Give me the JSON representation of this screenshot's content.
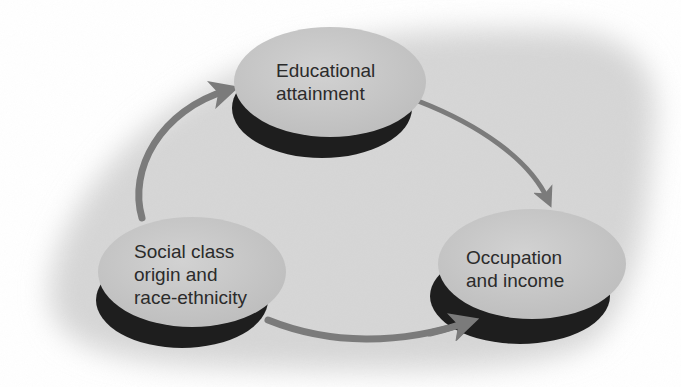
{
  "diagram": {
    "type": "flow-cycle",
    "colors": {
      "background_blob": "#d9d9d9",
      "node_face": "#c9c9c9",
      "node_shadow": "#1e1e1e",
      "arrow": "#7b7b7b",
      "text": "#2b2b2b"
    },
    "nodes": [
      {
        "id": "education",
        "lines": [
          "Educational",
          "attainment"
        ]
      },
      {
        "id": "origin",
        "lines": [
          "Social class",
          "origin and",
          "race-ethnicity"
        ]
      },
      {
        "id": "occupation",
        "lines": [
          "Occupation",
          "and income"
        ]
      }
    ],
    "edges": [
      {
        "from": "origin",
        "to": "education"
      },
      {
        "from": "education",
        "to": "occupation"
      },
      {
        "from": "origin",
        "to": "occupation"
      }
    ]
  }
}
